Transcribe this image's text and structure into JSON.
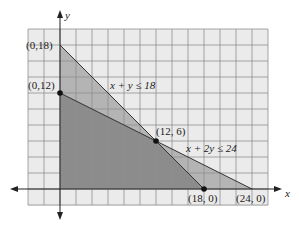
{
  "chart_data": {
    "type": "area",
    "title": "",
    "xlabel": "x",
    "ylabel": "y",
    "xlim": [
      -4,
      26
    ],
    "ylim": [
      -2,
      20
    ],
    "grid": true,
    "grid_step": 2,
    "constraints": [
      {
        "label": "x + y ≤ 18",
        "line": [
          [
            0,
            18
          ],
          [
            18,
            0
          ]
        ]
      },
      {
        "label": "x + 2y ≤ 24",
        "line": [
          [
            0,
            12
          ],
          [
            24,
            0
          ]
        ]
      }
    ],
    "regions": [
      {
        "name": "x + y ≤ 18 region",
        "vertices": [
          [
            0,
            0
          ],
          [
            0,
            18
          ],
          [
            18,
            0
          ]
        ],
        "color": "#b4b4b4"
      },
      {
        "name": "x + 2y ≤ 24 region",
        "vertices": [
          [
            0,
            0
          ],
          [
            0,
            12
          ],
          [
            24,
            0
          ]
        ],
        "color": "#b4b4b4"
      },
      {
        "name": "feasible region",
        "vertices": [
          [
            0,
            0
          ],
          [
            0,
            12
          ],
          [
            12,
            6
          ],
          [
            18,
            0
          ]
        ],
        "color": "#8c8c8c"
      }
    ],
    "points": [
      {
        "label": "(0,18)",
        "x": 0,
        "y": 18,
        "marker": false
      },
      {
        "label": "(0,12)",
        "x": 0,
        "y": 12,
        "marker": true
      },
      {
        "label": "(12, 6)",
        "x": 12,
        "y": 6,
        "marker": true
      },
      {
        "label": "(18, 0)",
        "x": 18,
        "y": 0,
        "marker": true
      },
      {
        "label": "(24, 0)",
        "x": 24,
        "y": 0,
        "marker": false
      }
    ]
  },
  "labels": {
    "x_axis": "x",
    "y_axis": "y",
    "c1": "x + y ≤ 18",
    "c2": "x + 2y ≤ 24",
    "p_0_18": "(0,18)",
    "p_0_12": "(0,12)",
    "p_12_6": "(12, 6)",
    "p_18_0": "(18, 0)",
    "p_24_0": "(24, 0)"
  },
  "colors": {
    "background": "#ebebeb",
    "grid": "#8f8f8f",
    "light_region": "#b4b4b4",
    "dark_region": "#8c8c8c",
    "axis": "#222222"
  }
}
